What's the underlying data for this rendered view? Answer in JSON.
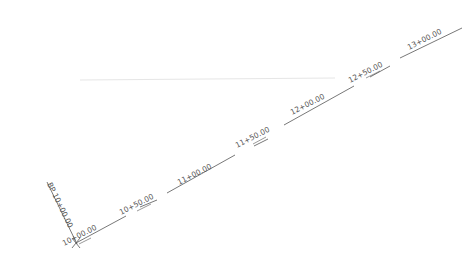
{
  "drawing": {
    "type": "alignment-stationing",
    "line_color": "#555555",
    "faint_line_color": "#e4e4e4",
    "begin_point_label": "BP 10+00.00",
    "origin_marker": "x-mark",
    "stations": [
      {
        "label": "10+00.00"
      },
      {
        "label": "10+50.00"
      },
      {
        "label": "11+00.00"
      },
      {
        "label": "11+50.00"
      },
      {
        "label": "12+00.00"
      },
      {
        "label": "12+50.00"
      },
      {
        "label": "13+00.00"
      }
    ]
  }
}
